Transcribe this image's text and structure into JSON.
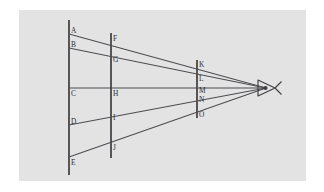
{
  "figure": {
    "background_color": "#ffffff",
    "panel_color": "#e3e3e3",
    "line_color": "#4d4d52",
    "plane_color": "#4a4a4f",
    "label_color": "#2e2e33",
    "panel": {
      "x": 19,
      "y": 10,
      "width": 287,
      "height": 171
    },
    "viewpoint": {
      "name": "eye",
      "x": 266,
      "y": 88,
      "icon": "eye-icon"
    },
    "planes": [
      {
        "name": "left-plane",
        "x": 69,
        "y_top": 20,
        "y_bottom": 175,
        "points": [
          {
            "label": "A",
            "x": 69,
            "y": 34,
            "label_x": 71,
            "label_y": 33
          },
          {
            "label": "B",
            "x": 69,
            "y": 48,
            "label_x": 71,
            "label_y": 47
          },
          {
            "label": "C",
            "x": 69,
            "y": 88,
            "label_x": 71,
            "label_y": 96
          },
          {
            "label": "D",
            "x": 69,
            "y": 125,
            "label_x": 71,
            "label_y": 124
          },
          {
            "label": "E",
            "x": 69,
            "y": 157,
            "label_x": 71,
            "label_y": 165
          }
        ]
      },
      {
        "name": "middle-plane",
        "x": 111,
        "y_top": 33,
        "y_bottom": 158,
        "points": [
          {
            "label": "F",
            "x": 111,
            "y": 40,
            "label_x": 113,
            "label_y": 41
          },
          {
            "label": "G",
            "x": 111,
            "y": 57,
            "label_x": 113,
            "label_y": 62
          },
          {
            "label": "H",
            "x": 111,
            "y": 88,
            "label_x": 113,
            "label_y": 96
          },
          {
            "label": "I",
            "x": 111,
            "y": 114,
            "label_x": 113,
            "label_y": 120
          },
          {
            "label": "J",
            "x": 111,
            "y": 142,
            "label_x": 113,
            "label_y": 150
          }
        ]
      },
      {
        "name": "right-plane",
        "x": 197,
        "y_top": 60,
        "y_bottom": 118,
        "points": [
          {
            "label": "K",
            "x": 197,
            "y": 62,
            "label_x": 199,
            "label_y": 67
          },
          {
            "label": "L",
            "x": 197,
            "y": 76,
            "label_x": 199,
            "label_y": 81
          },
          {
            "label": "M",
            "x": 197,
            "y": 88,
            "label_x": 199,
            "label_y": 93
          },
          {
            "label": "N",
            "x": 197,
            "y": 99,
            "label_x": 199,
            "label_y": 102
          },
          {
            "label": "O",
            "x": 197,
            "y": 112,
            "label_x": 199,
            "label_y": 117
          }
        ]
      }
    ],
    "rays": [
      {
        "name": "ray-A",
        "from_label": "A",
        "x1": 69,
        "y1": 34,
        "x2": 266,
        "y2": 88
      },
      {
        "name": "ray-B",
        "from_label": "B",
        "x1": 69,
        "y1": 48,
        "x2": 266,
        "y2": 88
      },
      {
        "name": "ray-C",
        "from_label": "C",
        "x1": 69,
        "y1": 88,
        "x2": 266,
        "y2": 88
      },
      {
        "name": "ray-D",
        "from_label": "D",
        "x1": 69,
        "y1": 125,
        "x2": 266,
        "y2": 88
      },
      {
        "name": "ray-E",
        "from_label": "E",
        "x1": 69,
        "y1": 157,
        "x2": 266,
        "y2": 88
      }
    ],
    "eye": {
      "outline": "M 258 80 L 275 88 L 258 96 Z",
      "tail": "M 275 88 L 281 82 M 275 88 L 281 94",
      "pupil": {
        "cx": 265.5,
        "cy": 88,
        "r": 2.1
      }
    }
  }
}
